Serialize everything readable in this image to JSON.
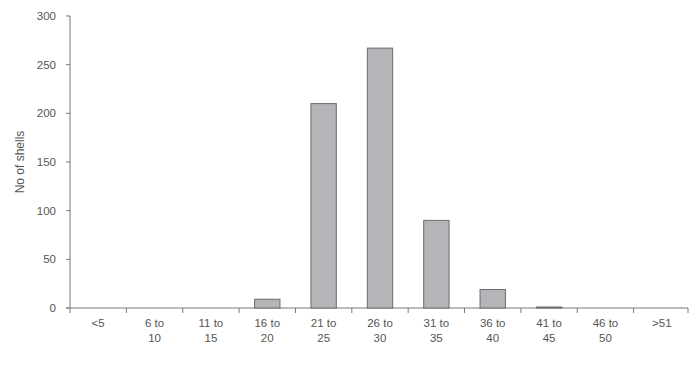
{
  "chart_data": {
    "type": "bar",
    "title": "",
    "xlabel": "",
    "ylabel": "No of shells",
    "ylim": [
      0,
      300
    ],
    "yticks": [
      0,
      50,
      100,
      150,
      200,
      250,
      300
    ],
    "grid": false,
    "legend": null,
    "categories": [
      "<5",
      "6 to 10",
      "11 to 15",
      "16 to 20",
      "21 to 25",
      "26 to 30",
      "31 to 35",
      "36 to 40",
      "41 to 45",
      "46 to 50",
      ">51"
    ],
    "category_lines": [
      [
        "<5"
      ],
      [
        "6 to",
        "10"
      ],
      [
        "11 to",
        "15"
      ],
      [
        "16 to",
        "20"
      ],
      [
        "21 to",
        "25"
      ],
      [
        "26 to",
        "30"
      ],
      [
        "31 to",
        "35"
      ],
      [
        "36 to",
        "40"
      ],
      [
        "41 to",
        "45"
      ],
      [
        "46 to",
        "50"
      ],
      [
        ">51"
      ]
    ],
    "values": [
      0,
      0,
      0,
      9,
      210,
      267,
      90,
      19,
      1,
      0,
      0
    ]
  },
  "style": {
    "bar_fill": "#b4b5b8",
    "bar_stroke": "#6b6b6b",
    "axis_color": "#777777"
  }
}
